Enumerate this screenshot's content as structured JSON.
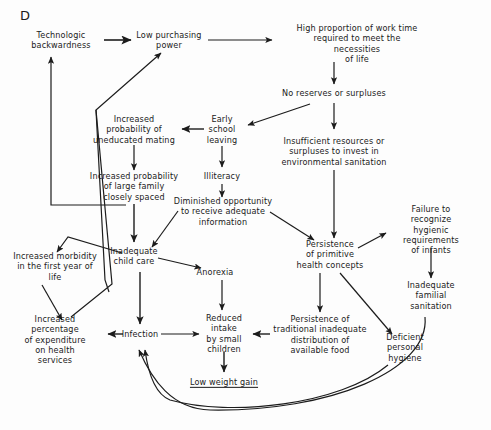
{
  "figure": {
    "panel_label": "D",
    "type": "causal-loop-diagram",
    "background_color": "#fdfdfd",
    "text_color": "#1a1a1a",
    "line_color": "#1c1c1c"
  },
  "nodes": [
    {
      "id": "tech_backwardness",
      "label": "Technologic\nbackwardness",
      "x": 61,
      "y": 40,
      "underlined": false
    },
    {
      "id": "low_purchasing",
      "label": "Low purchasing\npower",
      "x": 169,
      "y": 40,
      "underlined": false
    },
    {
      "id": "high_work_time",
      "label": "High proportion of work time\nrequired to meet the necessities\nof life",
      "x": 357,
      "y": 44,
      "underlined": false
    },
    {
      "id": "no_reserves",
      "label": "No reserves or surpluses",
      "x": 334,
      "y": 93,
      "underlined": false
    },
    {
      "id": "increased_uneducated_mating",
      "label": "Increased\nprobability of\nuneducated mating",
      "x": 134,
      "y": 129,
      "underlined": false
    },
    {
      "id": "early_school_leaving",
      "label": "Early\nschool\nleaving",
      "x": 222,
      "y": 129,
      "underlined": false
    },
    {
      "id": "insufficient_resources",
      "label": "Insufficient resources or\nsurpluses to invest in\nenvironmental sanitation",
      "x": 334,
      "y": 151,
      "underlined": false
    },
    {
      "id": "large_family",
      "label": "Increased probability\nof large family\nclosely spaced",
      "x": 134,
      "y": 186,
      "underlined": false
    },
    {
      "id": "illiteracy",
      "label": "Illiteracy",
      "x": 222,
      "y": 176,
      "underlined": false
    },
    {
      "id": "diminished_opportunity",
      "label": "Diminished opportunity\nto receive adequate\ninformation",
      "x": 223,
      "y": 211,
      "underlined": false
    },
    {
      "id": "failure_recognize_hygiene",
      "label": "Failure to recognize\nhygienic requirements\nof infants",
      "x": 431,
      "y": 230,
      "underlined": false
    },
    {
      "id": "persistence_primitive",
      "label": "Persistence\nof primitive\nhealth concepts",
      "x": 330,
      "y": 254,
      "underlined": false
    },
    {
      "id": "increased_morbidity",
      "label": "Increased morbidity\nin the first year of\nlife",
      "x": 55,
      "y": 266,
      "underlined": false
    },
    {
      "id": "inadequate_child_care",
      "label": "Inadequate\nchild care",
      "x": 134,
      "y": 256,
      "underlined": false
    },
    {
      "id": "anorexia",
      "label": "Anorexia",
      "x": 215,
      "y": 272,
      "underlined": false
    },
    {
      "id": "inadequate_familial_sanitation",
      "label": "Inadequate\nfamilial\nsanitation",
      "x": 431,
      "y": 295,
      "underlined": false
    },
    {
      "id": "persistence_traditional",
      "label": "Persistence of\ntraditional inadequate\ndistribution of\navailable food",
      "x": 320,
      "y": 335,
      "underlined": false
    },
    {
      "id": "increased_percentage",
      "label": "Increased\npercentage\nof expenditure\non health\nservices",
      "x": 55,
      "y": 340,
      "underlined": false
    },
    {
      "id": "infection",
      "label": "Infection",
      "x": 140,
      "y": 334,
      "underlined": false
    },
    {
      "id": "reduced_intake",
      "label": "Reduced\nintake\nby small\nchildren",
      "x": 224,
      "y": 334,
      "underlined": false
    },
    {
      "id": "deficient_hygiene",
      "label": "Deficient\npersonal\nhygiene",
      "x": 405,
      "y": 347,
      "underlined": false
    },
    {
      "id": "low_weight_gain",
      "label": "Low weight gain",
      "x": 224,
      "y": 382,
      "underlined": true
    }
  ],
  "edges": [
    {
      "from": "tech_backwardness",
      "to": "low_purchasing",
      "kind": "straight-arrow"
    },
    {
      "from": "low_purchasing",
      "to": "high_work_time",
      "kind": "straight-arrow"
    },
    {
      "from": "high_work_time",
      "to": "no_reserves",
      "kind": "straight-arrow"
    },
    {
      "from": "no_reserves",
      "to": "early_school_leaving",
      "kind": "diagonal-arrow"
    },
    {
      "from": "no_reserves",
      "to": "insufficient_resources",
      "kind": "straight-arrow"
    },
    {
      "from": "early_school_leaving",
      "to": "increased_uneducated_mating",
      "kind": "straight-arrow"
    },
    {
      "from": "early_school_leaving",
      "to": "illiteracy",
      "kind": "straight-arrow"
    },
    {
      "from": "increased_uneducated_mating",
      "to": "large_family",
      "kind": "straight-arrow"
    },
    {
      "from": "illiteracy",
      "to": "diminished_opportunity",
      "kind": "straight-arrow"
    },
    {
      "from": "insufficient_resources",
      "to": "persistence_primitive",
      "kind": "straight-arrow"
    },
    {
      "from": "large_family",
      "to": "inadequate_child_care",
      "kind": "straight-arrow"
    },
    {
      "from": "diminished_opportunity",
      "to": "inadequate_child_care",
      "kind": "diagonal-arrow"
    },
    {
      "from": "diminished_opportunity",
      "to": "persistence_primitive",
      "kind": "diagonal-arrow"
    },
    {
      "from": "inadequate_child_care",
      "to": "anorexia",
      "kind": "diagonal-arrow"
    },
    {
      "from": "inadequate_child_care",
      "to": "infection",
      "kind": "straight-arrow"
    },
    {
      "from": "persistence_primitive",
      "to": "failure_recognize_hygiene",
      "kind": "diagonal-arrow"
    },
    {
      "from": "persistence_primitive",
      "to": "persistence_traditional",
      "kind": "straight-arrow"
    },
    {
      "from": "persistence_primitive",
      "to": "deficient_hygiene",
      "kind": "diagonal-arrow"
    },
    {
      "from": "failure_recognize_hygiene",
      "to": "inadequate_familial_sanitation",
      "kind": "straight-arrow"
    },
    {
      "from": "anorexia",
      "to": "reduced_intake",
      "kind": "straight-arrow"
    },
    {
      "from": "increased_morbidity",
      "to": "increased_percentage",
      "kind": "diagonal-arrow"
    },
    {
      "from": "infection",
      "to": "increased_percentage",
      "kind": "straight-arrow"
    },
    {
      "from": "infection",
      "to": "reduced_intake",
      "kind": "straight-arrow"
    },
    {
      "from": "persistence_traditional",
      "to": "reduced_intake",
      "kind": "straight-arrow"
    },
    {
      "from": "reduced_intake",
      "to": "low_weight_gain",
      "kind": "straight-arrow"
    },
    {
      "from": "low_weight_gain",
      "to": "increased_morbidity",
      "kind": "polyline"
    },
    {
      "from": "inadequate_child_care",
      "to": "increased_morbidity",
      "kind": "polyline"
    },
    {
      "from": "increased_percentage",
      "to": "low_purchasing",
      "kind": "polyline"
    },
    {
      "from": "inadequate_child_care",
      "to": "tech_backwardness",
      "kind": "polyline"
    },
    {
      "from": "deficient_hygiene",
      "to": "infection",
      "kind": "curve"
    },
    {
      "from": "inadequate_familial_sanitation",
      "to": "infection",
      "kind": "curve"
    }
  ]
}
